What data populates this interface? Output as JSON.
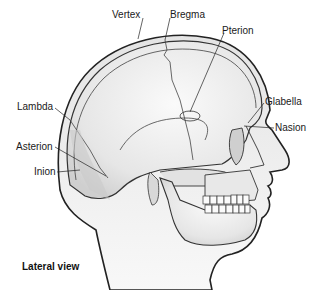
{
  "diagram": {
    "title": "Lateral view",
    "labels": {
      "vertex": "Vertex",
      "bregma": "Bregma",
      "pterion": "Pterion",
      "lambda": "Lambda",
      "glabella": "Glabella",
      "nasion": "Nasion",
      "asterion": "Asterion",
      "inion": "Inion"
    }
  }
}
